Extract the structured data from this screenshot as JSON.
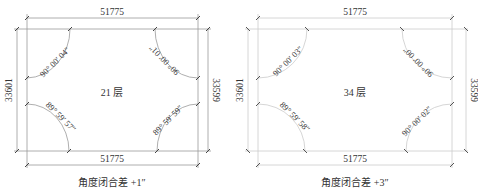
{
  "diagrams": [
    {
      "floor_label": "21 层",
      "top_dimension": "51775",
      "bottom_dimension": "51775",
      "left_dimension": "33601",
      "right_dimension": "33599",
      "angles": {
        "top_left": "90° 00′ 04″",
        "top_right": "90° 00′ 01″",
        "bottom_left": "89° 59′ 57″",
        "bottom_right": "89° 59′ 59″"
      },
      "caption": "角度闭合差 +1″",
      "line_color": "#999999"
    },
    {
      "floor_label": "34 层",
      "top_dimension": "51775",
      "bottom_dimension": "51775",
      "left_dimension": "33601",
      "right_dimension": "33599",
      "angles": {
        "top_left": "90° 00′ 03″",
        "top_right": "90° 00′ 00″",
        "bottom_left": "89° 59′ 58″",
        "bottom_right": "90° 00′ 02″"
      },
      "caption": "角度闭合差 +3″",
      "line_color": "#cfcfcf"
    }
  ]
}
